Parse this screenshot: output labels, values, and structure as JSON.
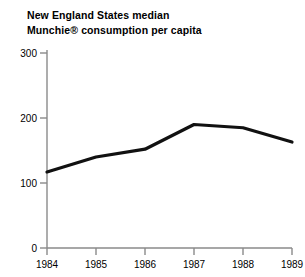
{
  "chart_data": {
    "type": "line",
    "title": "New England States median Munchie® consumption per capita",
    "title_lines": [
      "New England States median",
      "Munchie® consumption per capita"
    ],
    "xlabel": "",
    "ylabel": "",
    "categories": [
      "1984",
      "1985",
      "1986",
      "1987",
      "1988",
      "1989"
    ],
    "x": [
      1984,
      1985,
      1986,
      1987,
      1988,
      1989
    ],
    "values": [
      117,
      140,
      152,
      190,
      185,
      163
    ],
    "series": [
      {
        "name": "Munchie consumption per capita",
        "values": [
          117,
          140,
          152,
          190,
          185,
          163
        ]
      }
    ],
    "ylim": [
      0,
      300
    ],
    "xlim": [
      "1984",
      "1989"
    ],
    "yticks": [
      "0",
      "100",
      "200",
      "300"
    ],
    "ytick_values": [
      0,
      100,
      200,
      300
    ],
    "xticks": [
      "1984",
      "1985",
      "1986",
      "1987",
      "1988",
      "1989"
    ],
    "grid": false,
    "legend": false,
    "legend_position": "none",
    "line_color": "#111111",
    "axis_color": "#8a8a8a",
    "background_color": "#ffffff",
    "text_color": "#000000"
  }
}
